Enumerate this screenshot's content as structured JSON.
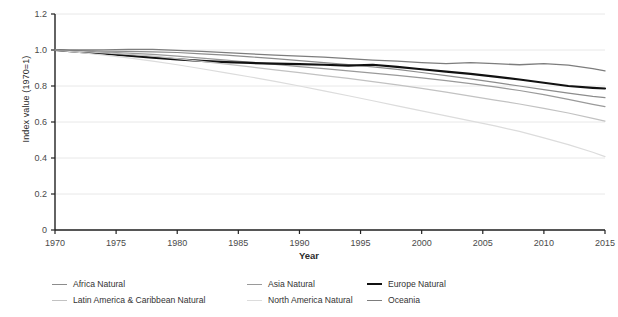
{
  "chart_data": {
    "type": "line",
    "title": "",
    "xlabel": "Year",
    "ylabel": "Index value (1970=1)",
    "xlim": [
      1970,
      2015
    ],
    "ylim": [
      0,
      1.2
    ],
    "xticks": [
      1970,
      1975,
      1980,
      1985,
      1990,
      1995,
      2000,
      2005,
      2010,
      2015
    ],
    "ytick_labels": [
      "0",
      "0.2",
      "0.4",
      "0.6",
      "0.8",
      "1.0",
      "1.2"
    ],
    "yticks": [
      0,
      0.2,
      0.4,
      0.6,
      0.8,
      1.0,
      1.2
    ],
    "grid": true,
    "legend_position": "bottom",
    "x": [
      1970,
      1972,
      1974,
      1976,
      1978,
      1980,
      1982,
      1984,
      1986,
      1988,
      1990,
      1992,
      1994,
      1996,
      1998,
      2000,
      2002,
      2004,
      2006,
      2008,
      2010,
      2012,
      2014,
      2015
    ],
    "series": [
      {
        "name": "Africa Natural",
        "color": "#8c8c8c",
        "width": 1.2,
        "values": [
          1.0,
          0.996,
          0.993,
          0.992,
          0.99,
          0.986,
          0.979,
          0.971,
          0.962,
          0.952,
          0.941,
          0.93,
          0.919,
          0.906,
          0.892,
          0.875,
          0.858,
          0.84,
          0.82,
          0.8,
          0.78,
          0.76,
          0.742,
          0.735
        ]
      },
      {
        "name": "Asia Natural",
        "color": "#9a9a9a",
        "width": 1.2,
        "values": [
          1.0,
          0.994,
          0.988,
          0.983,
          0.976,
          0.966,
          0.955,
          0.944,
          0.932,
          0.92,
          0.908,
          0.896,
          0.884,
          0.872,
          0.859,
          0.845,
          0.83,
          0.813,
          0.795,
          0.775,
          0.752,
          0.726,
          0.698,
          0.685
        ]
      },
      {
        "name": "Europe Natural",
        "color": "#111111",
        "width": 2.2,
        "values": [
          1.0,
          0.99,
          0.98,
          0.969,
          0.958,
          0.948,
          0.94,
          0.933,
          0.928,
          0.924,
          0.921,
          0.918,
          0.913,
          0.918,
          0.906,
          0.893,
          0.88,
          0.867,
          0.852,
          0.836,
          0.818,
          0.8,
          0.79,
          0.786
        ]
      },
      {
        "name": "Latin America & Caribbean Natural",
        "color": "#c2c2c2",
        "width": 1.2,
        "values": [
          1.0,
          0.992,
          0.984,
          0.976,
          0.966,
          0.952,
          0.937,
          0.922,
          0.906,
          0.89,
          0.874,
          0.858,
          0.842,
          0.824,
          0.806,
          0.787,
          0.766,
          0.744,
          0.722,
          0.7,
          0.676,
          0.65,
          0.62,
          0.605
        ]
      },
      {
        "name": "North America Natural",
        "color": "#dcdcdc",
        "width": 1.2,
        "values": [
          1.0,
          0.986,
          0.972,
          0.956,
          0.938,
          0.918,
          0.896,
          0.873,
          0.85,
          0.826,
          0.8,
          0.773,
          0.746,
          0.718,
          0.69,
          0.662,
          0.634,
          0.606,
          0.578,
          0.548,
          0.512,
          0.474,
          0.432,
          0.408
        ]
      },
      {
        "name": "Oceania",
        "color": "#7d7d7d",
        "width": 1.3,
        "values": [
          1.0,
          1.0,
          1.001,
          1.004,
          1.003,
          0.998,
          0.992,
          0.985,
          0.978,
          0.972,
          0.966,
          0.96,
          0.952,
          0.944,
          0.938,
          0.93,
          0.924,
          0.93,
          0.924,
          0.918,
          0.924,
          0.916,
          0.896,
          0.884
        ]
      }
    ]
  },
  "legend": {
    "items": [
      {
        "label": "Africa Natural",
        "color": "#8c8c8c",
        "bold": false
      },
      {
        "label": "Asia Natural",
        "color": "#9a9a9a",
        "bold": false
      },
      {
        "label": "Europe Natural",
        "color": "#111111",
        "bold": true
      },
      {
        "label": "Latin America & Caribbean Natural",
        "color": "#c2c2c2",
        "bold": false
      },
      {
        "label": "North America Natural",
        "color": "#dcdcdc",
        "bold": false
      },
      {
        "label": "Oceania",
        "color": "#7d7d7d",
        "bold": false
      }
    ]
  },
  "colors": {
    "grid": "#e8e8e8",
    "axis": "#222222",
    "text": "#4a4a4a",
    "background": "#ffffff"
  }
}
